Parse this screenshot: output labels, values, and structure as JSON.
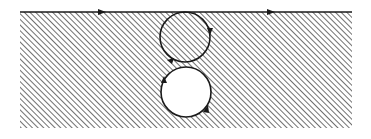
{
  "diagram": {
    "colors": {
      "stroke": "#1a1a1a",
      "hatch": "#333333",
      "background": "#ffffff"
    },
    "boundary_line": {
      "x1": 20,
      "x2": 352,
      "y": 12,
      "arrows": [
        {
          "x": 103,
          "direction": "right"
        },
        {
          "x": 272,
          "direction": "right"
        }
      ]
    },
    "region": {
      "x": 20,
      "y": 12,
      "width": 332,
      "height": 116
    },
    "upper_circle": {
      "cx": 185,
      "cy": 37,
      "r": 25,
      "filled": "hatched",
      "arrows": [
        "right-side-downward",
        "lower-left"
      ]
    },
    "lower_circle": {
      "cx": 186,
      "cy": 92,
      "r": 25,
      "filled": "white",
      "arrows": [
        "upper-left-upward",
        "lower-right-upward"
      ]
    }
  }
}
